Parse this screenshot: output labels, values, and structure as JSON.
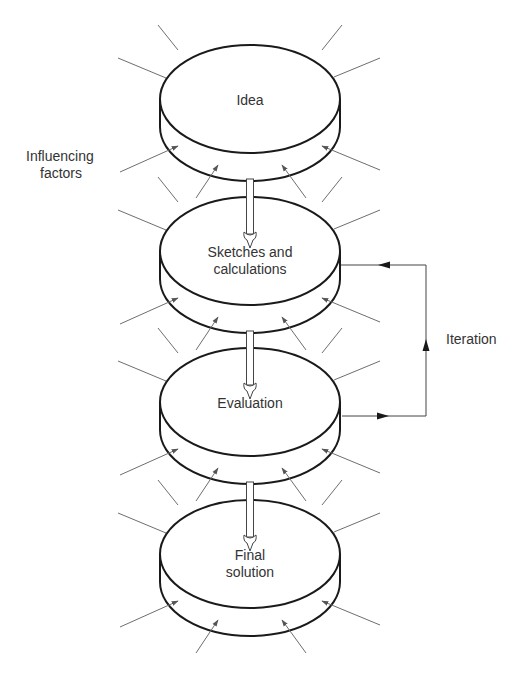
{
  "diagram": {
    "stages": [
      {
        "id": "idea",
        "lines": [
          "Idea"
        ],
        "top": 45
      },
      {
        "id": "sketches",
        "lines": [
          "Sketches and",
          "calculations"
        ],
        "top": 197
      },
      {
        "id": "evaluation",
        "lines": [
          "Evaluation"
        ],
        "top": 348
      },
      {
        "id": "final",
        "lines": [
          "Final",
          "solution"
        ],
        "top": 500
      }
    ],
    "influencing_factors_label": [
      "Influencing",
      "factors"
    ],
    "iteration_label": "Iteration",
    "colors": {
      "stroke": "#1a1a1a",
      "factor_line": "#6e6e6e",
      "text": "#333333",
      "background": "#ffffff"
    }
  }
}
